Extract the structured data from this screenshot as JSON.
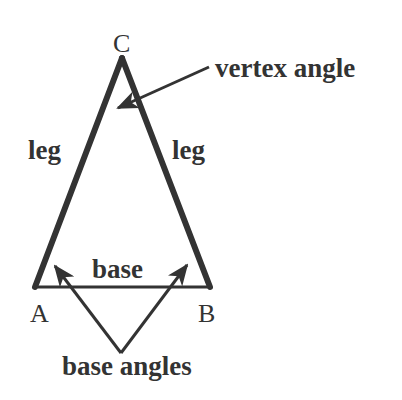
{
  "diagram": {
    "colors": {
      "ink": "#333333",
      "background": "#ffffff"
    },
    "vertices": {
      "A": {
        "label": "A",
        "x": 35,
        "y": 287
      },
      "B": {
        "label": "B",
        "x": 210,
        "y": 287
      },
      "C": {
        "label": "C",
        "x": 122,
        "y": 58
      }
    },
    "labels": {
      "vertex_angle": "vertex angle",
      "leg_left": "leg",
      "leg_right": "leg",
      "base": "base",
      "base_angles": "base angles"
    }
  }
}
